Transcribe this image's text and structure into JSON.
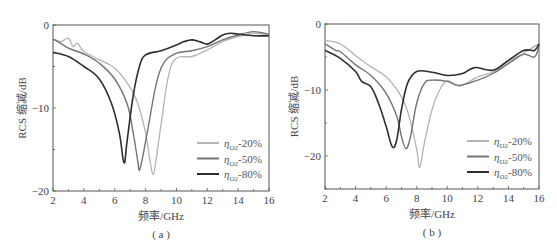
{
  "chart_data": [
    {
      "panel": "a",
      "type": "line",
      "caption": "( a )",
      "xlabel": "频率/GHz",
      "ylabel": "RCS 缩减/dB",
      "xlim": [
        2,
        16
      ],
      "ylim": [
        -20,
        0
      ],
      "xticks": [
        2,
        4,
        6,
        8,
        10,
        12,
        14,
        16
      ],
      "yticks": [
        0,
        -10,
        -20
      ],
      "grid": false,
      "legend_position": "lower right",
      "frame": {
        "left": 53,
        "top": 25,
        "right": 269,
        "bottom": 191
      },
      "series": [
        {
          "name": "ηO2-20%",
          "label_main": "η",
          "label_sub": "O2",
          "label_suffix": "-20%",
          "color": "#b4b4b4",
          "x": [
            2,
            2.5,
            3,
            3.3,
            3.6,
            4,
            5,
            6,
            7,
            7.5,
            8,
            8.3,
            8.5,
            8.7,
            9,
            9.5,
            10,
            11,
            12,
            13,
            14,
            15,
            16
          ],
          "y": [
            -1.7,
            -2,
            -1.6,
            -2.6,
            -2.2,
            -3.2,
            -4.2,
            -5.2,
            -7.5,
            -9.5,
            -13,
            -16.5,
            -18,
            -16,
            -12,
            -6,
            -4,
            -3.8,
            -3,
            -2,
            -1.4,
            -1,
            -1.2
          ]
        },
        {
          "name": "ηO2-50%",
          "label_main": "η",
          "label_sub": "O2",
          "label_suffix": "-50%",
          "color": "#747474",
          "x": [
            2,
            2.5,
            3,
            4,
            5,
            6,
            6.8,
            7.2,
            7.5,
            7.6,
            7.8,
            8.2,
            8.7,
            9.2,
            10,
            11,
            12,
            13,
            14,
            15,
            16
          ],
          "y": [
            -1.7,
            -2.2,
            -2.8,
            -3.5,
            -4.6,
            -6.5,
            -9.5,
            -13,
            -16.5,
            -17.5,
            -16,
            -12,
            -7,
            -4.5,
            -3.4,
            -3.1,
            -2.6,
            -1.8,
            -1.2,
            -0.8,
            -1.1
          ]
        },
        {
          "name": "ηO2-80%",
          "label_main": "η",
          "label_sub": "O2",
          "label_suffix": "-80%",
          "color": "#2e2e2e",
          "x": [
            2,
            3,
            4,
            5,
            5.8,
            6.3,
            6.6,
            6.8,
            7.2,
            7.6,
            8,
            9,
            10,
            10.5,
            11,
            11.5,
            12,
            12.5,
            13,
            13.5,
            14,
            15,
            16
          ],
          "y": [
            -3.3,
            -3.8,
            -5,
            -6.5,
            -9.5,
            -13,
            -16.6,
            -14,
            -8.5,
            -5,
            -3.6,
            -3.1,
            -2.4,
            -2,
            -1.8,
            -2,
            -2.3,
            -1.8,
            -1.2,
            -1,
            -1.1,
            -1.3,
            -1.3
          ]
        }
      ]
    },
    {
      "panel": "b",
      "type": "line",
      "caption": "( b )",
      "xlabel": "频率/GHz",
      "ylabel": "RCS 缩减/dB",
      "xlim": [
        2,
        16
      ],
      "ylim": [
        -25,
        0
      ],
      "xticks": [
        2,
        4,
        6,
        8,
        10,
        12,
        14,
        16
      ],
      "yticks": [
        0,
        -10,
        -20
      ],
      "grid": false,
      "legend_position": "lower right",
      "frame": {
        "left": 325,
        "top": 24,
        "right": 539,
        "bottom": 189
      },
      "series": [
        {
          "name": "ηO2-20%",
          "label_main": "η",
          "label_sub": "O2",
          "label_suffix": "-20%",
          "color": "#b4b4b4",
          "x": [
            2,
            3,
            4,
            5,
            6,
            7,
            7.5,
            8,
            8.2,
            8.5,
            9,
            9.5,
            10,
            10.8,
            12,
            13,
            14,
            15,
            16
          ],
          "y": [
            -2.5,
            -3,
            -4.8,
            -6.5,
            -8,
            -11,
            -14,
            -19,
            -21.7,
            -18,
            -13,
            -10,
            -8.6,
            -9.4,
            -8,
            -7.3,
            -5.7,
            -4.4,
            -3
          ]
        },
        {
          "name": "ηO2-50%",
          "label_main": "η",
          "label_sub": "O2",
          "label_suffix": "-50%",
          "color": "#747474",
          "x": [
            2,
            2.7,
            3,
            4,
            5,
            6,
            6.7,
            7,
            7.3,
            7.6,
            8,
            8.5,
            9,
            10,
            10.8,
            12,
            13,
            14,
            15,
            15.7,
            16
          ],
          "y": [
            -3,
            -4,
            -4.2,
            -6.2,
            -7.8,
            -10.5,
            -14,
            -17,
            -18.9,
            -17,
            -12,
            -9,
            -8.5,
            -8.7,
            -9.3,
            -8.5,
            -7.5,
            -6,
            -4.6,
            -5,
            -3.3
          ]
        },
        {
          "name": "ηO2-80%",
          "label_main": "η",
          "label_sub": "O2",
          "label_suffix": "-80%",
          "color": "#2e2e2e",
          "x": [
            2,
            3,
            4,
            4.4,
            5,
            5.5,
            6,
            6.4,
            6.7,
            7,
            7.4,
            8,
            9,
            10,
            11,
            11.8,
            13,
            14,
            15,
            15.7,
            16
          ],
          "y": [
            -4,
            -5.2,
            -7.2,
            -8.7,
            -9.5,
            -12,
            -15.5,
            -18.6,
            -17.5,
            -13,
            -9,
            -7.2,
            -7.3,
            -7.8,
            -7.5,
            -6.6,
            -7,
            -5.5,
            -4,
            -4,
            -3
          ]
        }
      ]
    }
  ]
}
